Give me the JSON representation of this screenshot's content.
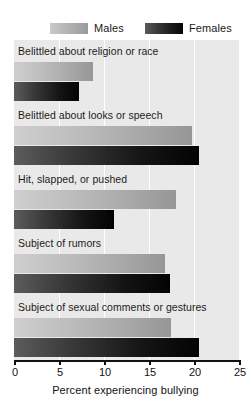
{
  "chart_data": {
    "type": "bar",
    "orientation": "horizontal",
    "title": "",
    "xlabel": "Percent experiencing bullying",
    "ylabel": "",
    "xlim": [
      0,
      25
    ],
    "xticks": [
      0,
      5,
      10,
      15,
      20,
      25
    ],
    "xtick_labels": [
      "0",
      "5",
      "10",
      "15",
      "20",
      "25"
    ],
    "grid": true,
    "grid_axis": "x",
    "legend_position": "top",
    "categories": [
      "Belittled about religion or race",
      "Belittled about looks or speech",
      "Hit, slapped, or pushed",
      "Subject of rumors",
      "Subject of sexual comments or gestures"
    ],
    "series": [
      {
        "name": "Males",
        "color": "#b4b4b4",
        "values": [
          8.8,
          19.8,
          18.0,
          16.8,
          17.4
        ]
      },
      {
        "name": "Females",
        "color": "#1a1a1a",
        "values": [
          7.2,
          20.5,
          11.1,
          17.3,
          20.5
        ]
      }
    ]
  },
  "legend": {
    "items": [
      {
        "label": "Males",
        "swatch": "males-swatch"
      },
      {
        "label": "Females",
        "swatch": "females-swatch"
      }
    ]
  },
  "axis": {
    "x_label": "Percent experiencing bullying",
    "ticks": [
      "0",
      "5",
      "10",
      "15",
      "20",
      "25"
    ]
  }
}
